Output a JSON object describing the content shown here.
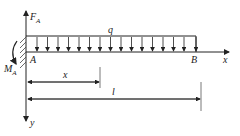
{
  "diagram": {
    "labels": {
      "force_A": "F",
      "force_A_sub": "A",
      "moment_A": "M",
      "moment_A_sub": "A",
      "load": "q",
      "point_A": "A",
      "point_B": "B",
      "axis_x": "x",
      "axis_y": "y",
      "dim_x": "x",
      "dim_l": "l"
    },
    "colors": {
      "line": "#222222"
    }
  }
}
